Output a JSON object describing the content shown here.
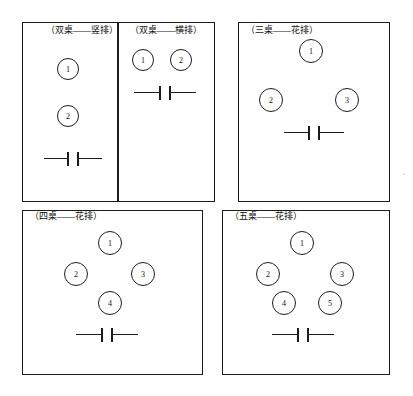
{
  "figure": {
    "title": "",
    "background_color": "#ffffff",
    "line_color": "#1c1c1c",
    "text_color": "#111111"
  },
  "panels": [
    {
      "id": "two-tables-vertical",
      "label": "（双桌——竖排）",
      "label_x": 46,
      "label_y": 25,
      "box": {
        "x": 22,
        "y": 22,
        "w": 96,
        "h": 180
      },
      "tables": [
        {
          "number": "1",
          "x": 57,
          "y": 58,
          "d": 22
        },
        {
          "number": "2",
          "x": 57,
          "y": 105,
          "d": 22
        }
      ],
      "door": {
        "x": 44,
        "y": 152,
        "w": 56
      }
    },
    {
      "id": "two-tables-horizontal",
      "label": "（双桌——横排）",
      "label_x": 130,
      "label_y": 25,
      "box": {
        "x": 118,
        "y": 22,
        "w": 97,
        "h": 180
      },
      "tables": [
        {
          "number": "1",
          "x": 132,
          "y": 49,
          "d": 22
        },
        {
          "number": "2",
          "x": 170,
          "y": 49,
          "d": 22
        }
      ],
      "door": {
        "x": 134,
        "y": 86,
        "w": 60
      }
    },
    {
      "id": "three-tables-staggered",
      "label": "（三桌——花排）",
      "label_x": 246,
      "label_y": 25,
      "box": {
        "x": 238,
        "y": 22,
        "w": 152,
        "h": 180
      },
      "tables": [
        {
          "number": "1",
          "x": 299,
          "y": 39,
          "d": 24
        },
        {
          "number": "2",
          "x": 259,
          "y": 88,
          "d": 24
        },
        {
          "number": "3",
          "x": 335,
          "y": 88,
          "d": 24
        }
      ],
      "door": {
        "x": 284,
        "y": 126,
        "w": 58
      }
    },
    {
      "id": "four-tables-staggered",
      "label": "（四桌——花排）",
      "label_x": 30,
      "label_y": 211,
      "box": {
        "x": 22,
        "y": 210,
        "w": 181,
        "h": 165
      },
      "tables": [
        {
          "number": "1",
          "x": 98,
          "y": 231,
          "d": 24
        },
        {
          "number": "2",
          "x": 64,
          "y": 262,
          "d": 24
        },
        {
          "number": "3",
          "x": 131,
          "y": 262,
          "d": 24
        },
        {
          "number": "4",
          "x": 98,
          "y": 291,
          "d": 24
        }
      ],
      "door": {
        "x": 76,
        "y": 328,
        "w": 60
      }
    },
    {
      "id": "five-tables-staggered",
      "label": "（五桌——花排）",
      "label_x": 230,
      "label_y": 211,
      "box": {
        "x": 222,
        "y": 210,
        "w": 168,
        "h": 165
      },
      "tables": [
        {
          "number": "1",
          "x": 290,
          "y": 231,
          "d": 24
        },
        {
          "number": "2",
          "x": 256,
          "y": 262,
          "d": 24
        },
        {
          "number": "3",
          "x": 330,
          "y": 262,
          "d": 24
        },
        {
          "number": "4",
          "x": 272,
          "y": 291,
          "d": 24
        },
        {
          "number": "5",
          "x": 318,
          "y": 291,
          "d": 24
        }
      ],
      "door": {
        "x": 272,
        "y": 328,
        "w": 60
      }
    }
  ],
  "panel_labels": {
    "two_tables_vertical": "（双桌——竖排）",
    "two_tables_horizontal": "（双桌——横排）",
    "three_tables": "（三桌——花排）",
    "four_tables": "（四桌——花排）",
    "five_tables": "（五桌——花排）"
  },
  "stray_mark": "ʻ"
}
